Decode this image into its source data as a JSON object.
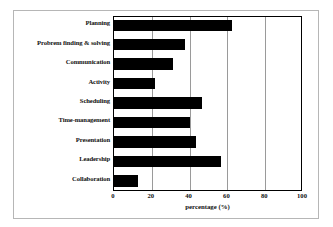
{
  "chart_data": {
    "type": "bar",
    "orientation": "horizontal",
    "title": "",
    "xlabel": "percentage (%)",
    "ylabel": "",
    "xlim": [
      0,
      100
    ],
    "xticks": [
      0,
      20,
      40,
      60,
      80,
      100
    ],
    "grid": true,
    "legend": null,
    "bar_color": "#000000",
    "categories": [
      "Planning",
      "Probrem finding & solving",
      "Communication",
      "Activity",
      "Scheduling",
      "Time-management",
      "Presentation",
      "Leadership",
      "Collaboration"
    ],
    "values": [
      63,
      38,
      32,
      22,
      47,
      41,
      44,
      57,
      13
    ]
  },
  "axis": {
    "tick_labels": [
      "0",
      "20",
      "40",
      "60",
      "80",
      "100"
    ],
    "title": "percentage (%)"
  },
  "colors": {
    "bar": "#000000",
    "grid": "#9a9a9a",
    "frame": "#000000",
    "outer_frame": "#b6b6b6",
    "background": "#ffffff"
  }
}
